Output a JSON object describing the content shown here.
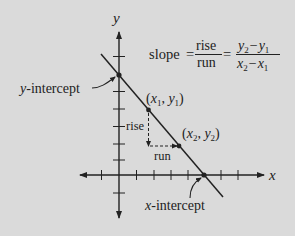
{
  "diagram": {
    "axes": {
      "x_label": "x",
      "y_label": "y"
    },
    "formula": {
      "lhs": "slope",
      "eq": "=",
      "frac1_num": "rise",
      "frac1_den": "run",
      "eq2": "=",
      "frac2_num": {
        "a": "y",
        "a_sub": "2",
        "op": "−",
        "b": "y",
        "b_sub": "1"
      },
      "frac2_den": {
        "a": "x",
        "a_sub": "2",
        "op": "−",
        "b": "x",
        "b_sub": "1"
      }
    },
    "labels": {
      "y_intercept": "-intercept",
      "y_intercept_var": "y",
      "x_intercept": "-intercept",
      "x_intercept_var": "x",
      "rise": "rise",
      "run": "run"
    },
    "points": {
      "p1": {
        "open": "(",
        "x": "x",
        "x_sub": "1",
        "comma": ", ",
        "y": "y",
        "y_sub": "1",
        "close": ")"
      },
      "p2": {
        "open": "(",
        "x": "x",
        "x_sub": "2",
        "comma": ", ",
        "y": "y",
        "y_sub": "2",
        "close": ")"
      }
    },
    "colors": {
      "background": "#dadada",
      "ink": "#222222"
    }
  }
}
